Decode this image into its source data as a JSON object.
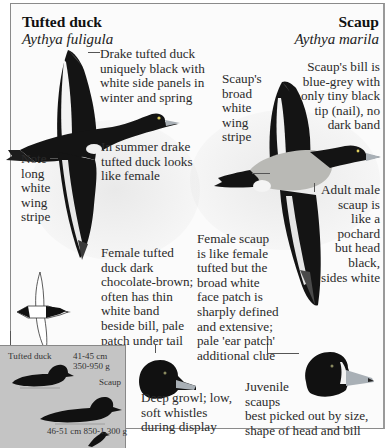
{
  "tufted_duck": {
    "common_name": "Tufted duck",
    "scientific_name": "Aythya fuligula",
    "notes": {
      "drake": [
        "Drake tufted duck",
        "uniquely black with",
        "white side panels in",
        "winter and spring"
      ],
      "summer": [
        "In summer drake",
        "tufted duck looks",
        "like female"
      ],
      "wing_stripe": [
        "Note",
        "long",
        "white",
        "wing",
        "stripe"
      ],
      "female": [
        "Female tufted",
        "duck dark",
        "chocolate-brown;",
        "often has thin",
        "white band",
        "beside bill, pale",
        "patch under tail"
      ],
      "call": [
        "Deep growl; low,",
        "soft whistles",
        "during display"
      ]
    }
  },
  "scaup": {
    "common_name": "Scaup",
    "scientific_name": "Aythya marila",
    "notes": {
      "bill": [
        "Scaup's bill is",
        "blue-grey with",
        "only tiny black",
        "tip (nail), no",
        "dark band"
      ],
      "wing_stripe": [
        "Scaup's",
        "broad",
        "white",
        "wing",
        "stripe"
      ],
      "adult_male": [
        "Adult male",
        "scaup is",
        "like a",
        "pochard",
        "but head",
        "black,",
        "sides white"
      ],
      "female": [
        "Female scaup",
        "is like female",
        "tufted but the",
        "broad white",
        "face patch is",
        "sharply defined",
        "and extensive;",
        "pale 'ear patch'",
        "additional clue"
      ],
      "juvenile": [
        "Juvenile",
        "scaups",
        "best picked out by size,",
        "shape of head and bill"
      ]
    }
  },
  "size_comparison": {
    "tufted_label": "Tufted duck",
    "tufted_length": "41-45 cm",
    "tufted_weight": "350-950 g",
    "scaup_label": "Scaup",
    "scaup_measure": "46-51 cm  850-1,300 g"
  },
  "colors": {
    "frame_border": "#8a8a8a",
    "size_box": "#c4c4c4",
    "scaup_flank": "#b9b9b5",
    "bill": "#a9b0b6",
    "plumage": "#111111"
  }
}
